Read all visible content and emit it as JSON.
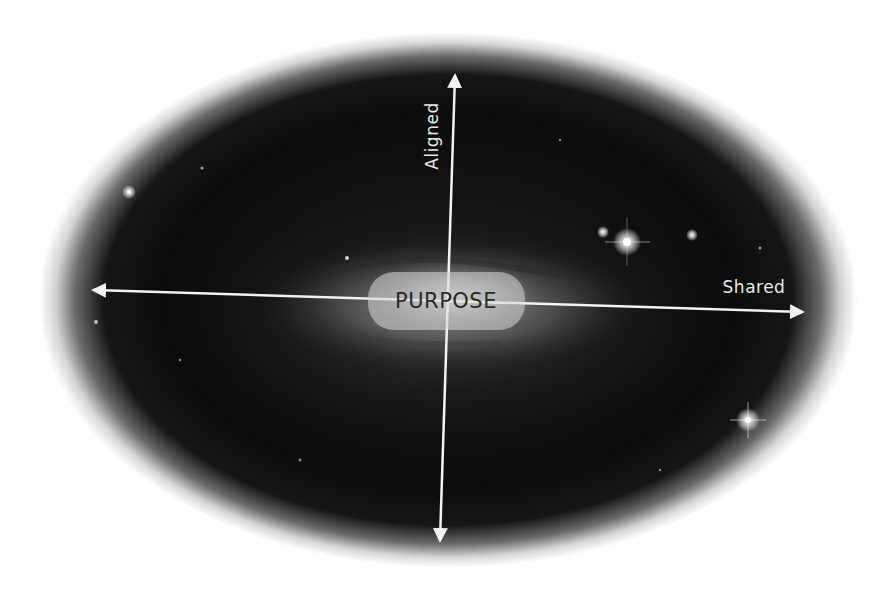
{
  "diagram": {
    "center_label": "PURPOSE",
    "axes": [
      {
        "name": "horizontal",
        "label": "Shared",
        "direction": "bidirectional"
      },
      {
        "name": "vertical",
        "label": "Aligned",
        "direction": "bidirectional"
      }
    ],
    "background": "galaxy-image-ellipse",
    "colors": {
      "page_bg": "#ffffff",
      "space": "#0e0e0e",
      "arrow": "#f2f2f2",
      "label_text": "#e8e8e8",
      "center_text": "#2a2a2a",
      "pill_fill": "#d8d8d8"
    }
  }
}
